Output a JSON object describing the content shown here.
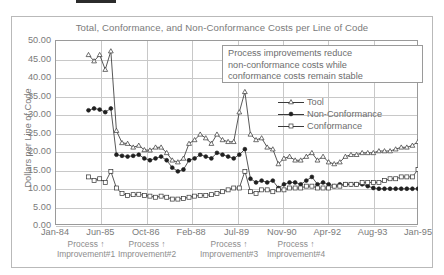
{
  "chart_data": {
    "type": "line",
    "title": "Total, Conformance, and Non-Conformance Costs per Line of Code",
    "xlabel": "",
    "ylabel": "Dollars per Line of Code",
    "ylim": [
      0,
      50
    ],
    "ytick_step": 5,
    "ytick_labels": [
      "50.00",
      "45.00",
      "40.00",
      "35.00",
      "30.00",
      "25.00",
      "20.00",
      "15.00",
      "10.00",
      "5.00",
      "0.00"
    ],
    "xtick_labels": [
      "Jan-84",
      "Jun-85",
      "Oct-86",
      "Feb-88",
      "Jul-89",
      "Nov-90",
      "Apr-92",
      "Aug-93",
      "Jan-95"
    ],
    "grid": true,
    "legend_position": "inside-right",
    "series": [
      {
        "name": "Tool",
        "marker": "open-triangle",
        "values": [
          null,
          null,
          null,
          null,
          null,
          null,
          46.0,
          44.3,
          46.0,
          42.0,
          47.0,
          25.5,
          22.2,
          22.0,
          21.0,
          21.5,
          20.3,
          20.2,
          21.0,
          21.0,
          19.5,
          17.5,
          17.0,
          18.0,
          22.0,
          23.0,
          24.5,
          23.5,
          22.0,
          24.5,
          23.0,
          22.5,
          22.5,
          30.5,
          36.0,
          24.5,
          23.0,
          23.5,
          21.0,
          20.5,
          16.5,
          18.0,
          18.5,
          17.5,
          17.5,
          18.5,
          19.5,
          17.5,
          18.5,
          17.0,
          16.5,
          17.0,
          18.5,
          19.0,
          19.0,
          19.5,
          19.5,
          19.5,
          20.0,
          20.0,
          20.0,
          20.5,
          21.0,
          21.0,
          21.5,
          22.5
        ]
      },
      {
        "name": "Non-Conformance",
        "marker": "filled-circle",
        "values": [
          null,
          null,
          null,
          null,
          null,
          null,
          31.0,
          31.5,
          31.2,
          30.5,
          31.5,
          19.0,
          18.7,
          18.5,
          18.7,
          19.0,
          18.0,
          17.5,
          18.0,
          18.5,
          17.5,
          15.5,
          14.5,
          15.0,
          17.5,
          18.0,
          19.0,
          18.5,
          18.0,
          19.5,
          19.0,
          18.5,
          18.0,
          19.0,
          20.5,
          12.5,
          11.5,
          12.0,
          11.5,
          12.0,
          10.0,
          11.0,
          11.5,
          11.5,
          11.0,
          12.0,
          13.0,
          11.0,
          11.5,
          11.0,
          10.5,
          11.0,
          11.0,
          11.0,
          11.0,
          11.0,
          10.5,
          10.0,
          9.8,
          9.8,
          9.8,
          9.8,
          9.8,
          9.8,
          9.8,
          9.8
        ]
      },
      {
        "name": "Conformance",
        "marker": "open-square",
        "values": [
          null,
          null,
          null,
          null,
          null,
          null,
          13.0,
          12.0,
          12.5,
          11.5,
          14.5,
          10.0,
          8.5,
          8.0,
          8.2,
          8.3,
          8.0,
          7.8,
          7.5,
          7.8,
          7.5,
          7.0,
          7.0,
          7.2,
          7.5,
          7.8,
          8.0,
          8.0,
          8.2,
          8.5,
          9.0,
          9.5,
          10.0,
          10.0,
          14.5,
          9.0,
          8.5,
          9.5,
          9.5,
          9.0,
          9.5,
          9.5,
          10.0,
          10.0,
          10.0,
          10.5,
          10.5,
          10.0,
          10.0,
          10.0,
          10.5,
          10.5,
          11.0,
          11.0,
          11.0,
          11.5,
          11.5,
          11.5,
          11.5,
          12.0,
          12.5,
          12.5,
          13.0,
          13.0,
          13.0,
          15.0
        ]
      }
    ]
  },
  "callout": {
    "line1": "Process improvements reduce",
    "line2": "non-conformance costs while",
    "line3": "conformance costs remain stable"
  },
  "legend": {
    "items": [
      {
        "label": "Tool"
      },
      {
        "label": "Non-Conformance"
      },
      {
        "label": "Conformance"
      }
    ]
  },
  "annotations": [
    {
      "line1": "Process ↑",
      "line2": "Improvement#1",
      "x": 86
    },
    {
      "line1": "Process ↑",
      "line2": "Improvement#2",
      "x": 147
    },
    {
      "line1": "Process ↑",
      "line2": "Improvement#3",
      "x": 229
    },
    {
      "line1": "Process ↑",
      "line2": "Improvement#4",
      "x": 296
    }
  ]
}
